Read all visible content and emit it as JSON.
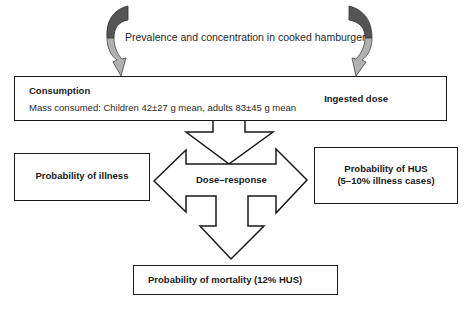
{
  "top_label": "Prevalence and concentration in cooked hamburger",
  "consumption": {
    "title": "Consumption",
    "mass_consumed": "Mass consumed: Children 42±27 g mean, adults 83±45 g mean",
    "ingested_dose": "Ingested dose"
  },
  "center": {
    "label": "Dose–response"
  },
  "illness": {
    "label": "Probability of illness"
  },
  "hus": {
    "line1": "Probability of HUS",
    "line2": "(5–10% illness cases)"
  },
  "mortality": {
    "label": "Probability of mortality (12% HUS)"
  },
  "colors": {
    "curved_arrow_dark": "#555555",
    "curved_arrow_light": "#b0b0b0",
    "outline": "#1a1a1a"
  }
}
